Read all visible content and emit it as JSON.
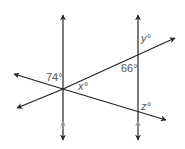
{
  "diagram": {
    "type": "geometry-angles",
    "labels": {
      "angle_74": "74°",
      "angle_x": "x°",
      "angle_66": "66°",
      "angle_y": "y°",
      "angle_z": "z°"
    },
    "colors": {
      "line": "#222222",
      "marker": "#999999",
      "text": "#555555"
    }
  }
}
